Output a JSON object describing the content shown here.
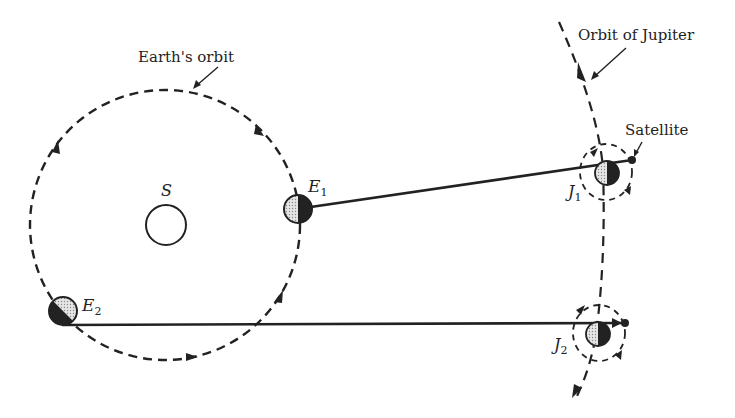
{
  "figure": {
    "labels": {
      "earth_orbit": "Earth's orbit",
      "jupiter_orbit": "Orbit of Jupiter",
      "satellite": "Satellite",
      "sun": "S",
      "e1_main": "E",
      "e1_sub": "1",
      "e2_main": "E",
      "e2_sub": "2",
      "j1_main": "J",
      "j1_sub": "1",
      "j2_main": "J",
      "j2_sub": "2"
    },
    "colors": {
      "ink": "#222222",
      "background": "#ffffff",
      "lit_side": "#d8d8d8"
    }
  }
}
